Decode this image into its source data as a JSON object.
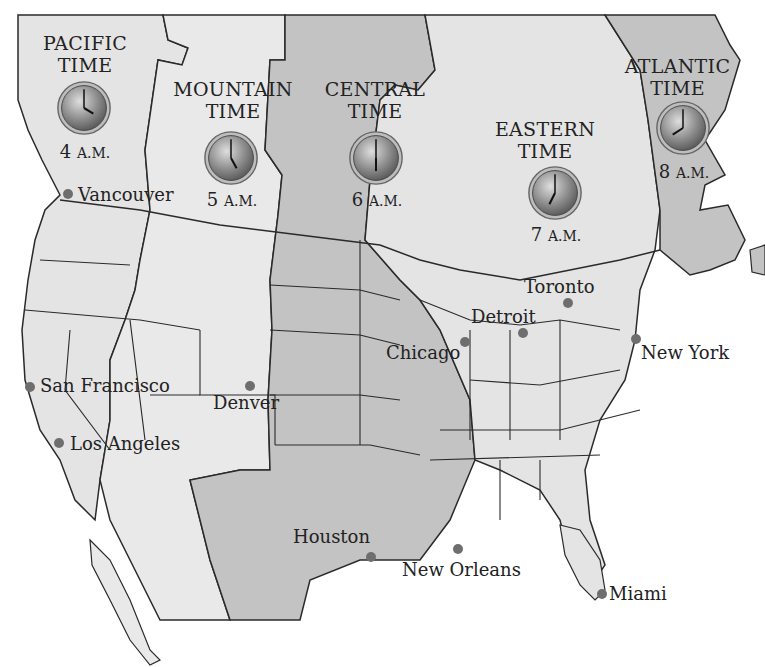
{
  "colors": {
    "zone_light": "#e4e4e4",
    "zone_dark": "#c3c3c3",
    "border": "#2a2a2a",
    "water": "#ffffff",
    "city_dot": "#6e6e6e",
    "text": "#222222"
  },
  "zones": [
    {
      "name_line1": "PACIFIC",
      "name_line2": "TIME",
      "hour": "4",
      "ampm": "A.M."
    },
    {
      "name_line1": "MOUNTAIN",
      "name_line2": "TIME",
      "hour": "5",
      "ampm": "A.M."
    },
    {
      "name_line1": "CENTRAL",
      "name_line2": "TIME",
      "hour": "6",
      "ampm": "A.M."
    },
    {
      "name_line1": "EASTERN",
      "name_line2": "TIME",
      "hour": "7",
      "ampm": "A.M."
    },
    {
      "name_line1": "ATLANTIC",
      "name_line2": "TIME",
      "hour": "8",
      "ampm": "A.M."
    }
  ],
  "cities": [
    {
      "name": "Vancouver"
    },
    {
      "name": "San Francisco"
    },
    {
      "name": "Los Angeles"
    },
    {
      "name": "Denver"
    },
    {
      "name": "Houston"
    },
    {
      "name": "Chicago"
    },
    {
      "name": "Detroit"
    },
    {
      "name": "Toronto"
    },
    {
      "name": "New York"
    },
    {
      "name": "New Orleans"
    },
    {
      "name": "Miami"
    }
  ]
}
